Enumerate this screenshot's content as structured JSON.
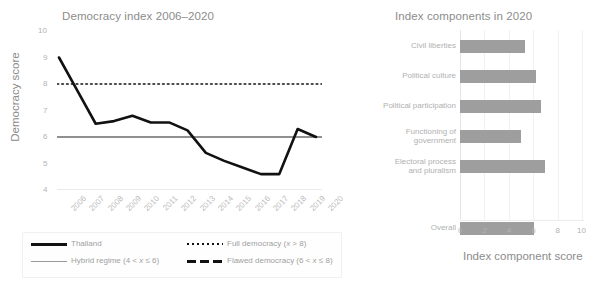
{
  "figure": {
    "width": 612,
    "height": 288,
    "background": "#ffffff"
  },
  "left_panel": {
    "title": "Democracy index 2006–2020",
    "y_axis_label": "Democracy score",
    "y_ticks": [
      "4",
      "5",
      "6",
      "7",
      "8",
      "9",
      "10"
    ],
    "x_ticks": [
      "2006",
      "2007",
      "2008",
      "2009",
      "2010",
      "2011",
      "2012",
      "2013",
      "2014",
      "2015",
      "2016",
      "2017",
      "2018",
      "2019",
      "2020"
    ]
  },
  "legend": {
    "items": [
      {
        "label": "Thailand",
        "style": "solid-thick",
        "color": "#111111"
      },
      {
        "label": "Full democracy (x > 8)",
        "style": "dotted",
        "color": "#111111"
      },
      {
        "label": "Hybrid regime (4 < x ≤ 6)",
        "style": "solid-thin",
        "color": "#9a9a9a"
      },
      {
        "label": "Flawed democracy (6 < x ≤ 8)",
        "style": "dashed",
        "color": "#111111"
      }
    ]
  },
  "right_panel": {
    "title": "Index components in 2020",
    "x_axis_label": "Index component score",
    "x_ticks": [
      "0",
      "2",
      "4",
      "6",
      "8",
      "10"
    ]
  },
  "chart_data": [
    {
      "type": "line",
      "title": "Democracy index 2006–2020",
      "xlabel": "",
      "ylabel": "Democracy score",
      "ylim": [
        4,
        10
      ],
      "grid": false,
      "legend_position": "below-axes",
      "categories": [
        "2006",
        "2007",
        "2008",
        "2009",
        "2010",
        "2011",
        "2012",
        "2013",
        "2014",
        "2015",
        "2016",
        "2017",
        "2018",
        "2019",
        "2020"
      ],
      "series": [
        {
          "name": "Thailand",
          "style": "solid-thick",
          "color": "#111111",
          "values": [
            9.0,
            7.75,
            6.5,
            6.6,
            6.8,
            6.55,
            6.55,
            6.25,
            5.4,
            5.1,
            4.85,
            4.6,
            4.6,
            6.3,
            6.0
          ]
        }
      ],
      "reference_lines": [
        {
          "name": "Full democracy (x > 8)",
          "value": 8,
          "style": "dotted",
          "color": "#111111"
        },
        {
          "name": "Flawed democracy (6 < x ≤ 8)",
          "value": 6,
          "style": "solid-thin",
          "color": "#6b6b6b"
        },
        {
          "name": "Hybrid regime (4 < x ≤ 6)",
          "value": 4,
          "style": "solid-thin",
          "color": "#d8d8d8"
        }
      ]
    },
    {
      "type": "bar",
      "orientation": "horizontal",
      "title": "Index components in 2020",
      "xlabel": "Index component score",
      "ylabel": "",
      "xlim": [
        0,
        10
      ],
      "grid": true,
      "bar_color": "#9e9e9e",
      "categories": [
        "Civil liberties",
        "Political culture",
        "Political participation",
        "Functioning of\ngovernment",
        "Electoral process\nand pluralism",
        "Overall"
      ],
      "values": [
        5.29,
        6.25,
        6.67,
        5.0,
        7.0,
        6.04
      ]
    }
  ]
}
